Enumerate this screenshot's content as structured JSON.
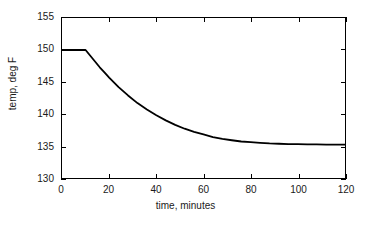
{
  "chart_data": {
    "type": "line",
    "title": "",
    "xlabel": "time, minutes",
    "ylabel": "temp, deg F",
    "xlim": [
      0,
      120
    ],
    "ylim": [
      130,
      155
    ],
    "xticks": [
      0,
      20,
      40,
      60,
      80,
      100,
      120
    ],
    "yticks": [
      130,
      135,
      140,
      145,
      150,
      155
    ],
    "xtick_labels": [
      "0",
      "20",
      "40",
      "60",
      "80",
      "100",
      "120"
    ],
    "ytick_labels": [
      "130",
      "135",
      "140",
      "145",
      "150",
      "155"
    ],
    "grid": false,
    "legend": null,
    "line_color": "#000000",
    "line_width": 1.6,
    "series": [
      {
        "name": "temperature",
        "x": [
          0,
          2,
          4,
          6,
          8,
          10,
          12,
          14,
          16,
          18,
          20,
          24,
          28,
          32,
          36,
          40,
          44,
          48,
          52,
          56,
          60,
          64,
          68,
          72,
          76,
          80,
          84,
          88,
          92,
          96,
          100,
          104,
          108,
          112,
          116,
          120
        ],
        "y": [
          150.0,
          150.0,
          150.0,
          150.0,
          150.0,
          150.0,
          149.1,
          148.2,
          147.3,
          146.5,
          145.7,
          144.2,
          142.9,
          141.7,
          140.7,
          139.8,
          139.0,
          138.3,
          137.7,
          137.2,
          136.8,
          136.4,
          136.1,
          135.9,
          135.7,
          135.6,
          135.5,
          135.4,
          135.35,
          135.3,
          135.28,
          135.26,
          135.24,
          135.23,
          135.22,
          135.2
        ]
      }
    ],
    "annotations": [
      {
        "text": "hold at 150 deg F until t = 10 min",
        "x": 5,
        "y": 150
      },
      {
        "text": "asymptote near 135.2 deg F",
        "x": 120,
        "y": 135.2
      }
    ]
  }
}
